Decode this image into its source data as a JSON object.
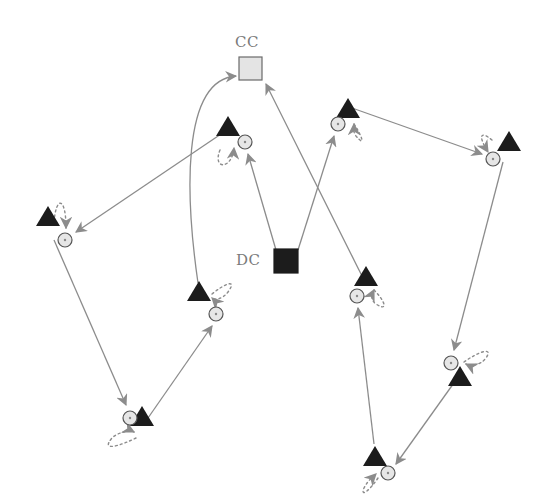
{
  "diagram": {
    "width": 544,
    "height": 502,
    "colors": {
      "edge": "#8c8c8c",
      "arrowhead": "#8c8c8c",
      "triangle": "#1c1c1c",
      "sensor_fill": "#e6e6e6",
      "sensor_stroke": "#555555",
      "cc_fill": "#e4e4e4",
      "cc_stroke": "#6a6a6a",
      "dc_fill": "#1c1c1c",
      "label": "#7a7a7a"
    },
    "stations": [
      {
        "id": "CC",
        "label": "CC",
        "x": 239,
        "y": 57,
        "size": 23,
        "fill": "#e4e4e4",
        "stroke": "#6a6a6a",
        "label_x": 235,
        "label_y": 47
      },
      {
        "id": "DC",
        "label": "DC",
        "x": 274,
        "y": 249,
        "size": 24,
        "fill": "#1c1c1c",
        "stroke": "#1c1c1c",
        "label_x": 236,
        "label_y": 265
      }
    ],
    "nodes": [
      {
        "id": "T1",
        "tri": [
          228,
          120
        ],
        "circle": [
          245,
          142
        ],
        "loop": "M220 150 C212 170, 232 170, 234 148"
      },
      {
        "id": "T2",
        "tri": [
          48,
          210
        ],
        "circle": [
          65,
          240
        ],
        "loop": "M54 222 C56 196, 66 196, 66 228"
      },
      {
        "id": "T3",
        "tri": [
          142,
          410
        ],
        "circle": [
          130,
          418
        ],
        "loop": "M136 438 C120 446, 100 452, 112 438 C118 432, 130 430, 134 432"
      },
      {
        "id": "T4",
        "tri": [
          199,
          285
        ],
        "circle": [
          216,
          314
        ],
        "loop": "M212 294 C224 284, 238 278, 228 292 C222 300, 214 300, 212 298"
      },
      {
        "id": "T5",
        "tri": [
          348,
          102
        ],
        "circle": [
          338,
          124
        ],
        "loop": "M354 124 C362 136, 366 148, 356 136 C352 130, 354 126, 354 124"
      },
      {
        "id": "T6",
        "tri": [
          509,
          135
        ],
        "circle": [
          493,
          159
        ],
        "loop": "M492 140 C480 130, 478 136, 488 152"
      },
      {
        "id": "T7",
        "tri": [
          366,
          270
        ],
        "circle": [
          357,
          296
        ],
        "loop": "M374 290 C386 302, 388 312, 376 304 C370 300, 372 294, 374 290"
      },
      {
        "id": "T8",
        "tri": [
          460,
          370
        ],
        "circle": [
          451,
          363
        ],
        "loop": "M464 362 C478 352, 494 346, 486 358 C480 366, 470 366, 466 364"
      },
      {
        "id": "T9",
        "tri": [
          375,
          450
        ],
        "circle": [
          388,
          473
        ],
        "loop": "M378 478 C370 490, 360 498, 364 488 C368 480, 374 476, 376 474"
      }
    ],
    "edges": [
      {
        "from": "DC",
        "to": "T1",
        "path": "M276 250 L248 154"
      },
      {
        "from": "T1",
        "to": "T2",
        "path": "M224 132 L76 232"
      },
      {
        "from": "T2",
        "to": "T3",
        "path": "M54 240 L126 405"
      },
      {
        "from": "T3",
        "to": "T4",
        "path": "M148 418 L212 326"
      },
      {
        "from": "T4",
        "to": "CC",
        "path": "M198 283 C186 200, 180 80, 236 76"
      },
      {
        "from": "DC",
        "to": "T5",
        "path": "M298 250 L334 136"
      },
      {
        "from": "T5",
        "to": "T6",
        "path": "M352 108 L482 154"
      },
      {
        "from": "T6",
        "to": "T8",
        "path": "M503 162 L454 350"
      },
      {
        "from": "T8",
        "to": "T9",
        "path": "M456 380 L396 464"
      },
      {
        "from": "T9",
        "to": "T7",
        "path": "M374 444 L358 308"
      },
      {
        "from": "T7",
        "to": "CC",
        "path": "M362 276 L266 84"
      }
    ]
  }
}
